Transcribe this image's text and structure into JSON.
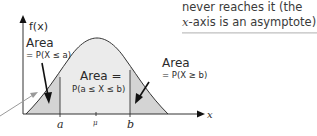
{
  "note": {
    "line1": "never reaches it (the",
    "line2_italic": "x",
    "line2_rest": "-axis is an asymptote)."
  },
  "diagram": {
    "y_axis_label": "f(x)",
    "x_axis_label": "x",
    "left_area": {
      "title": "Area",
      "formula": "= P(X ≤ a)"
    },
    "right_area": {
      "title": "Area",
      "formula": "= P(X ≥ b)"
    },
    "center_area": {
      "title": "Area =",
      "formula": "P(a ≤ X ≤ b)"
    },
    "ticks": {
      "a": "a",
      "mu": "μ",
      "b": "b"
    }
  },
  "colors": {
    "tail_fill": "#d4d4d4",
    "center_fill": "#ebebeb",
    "curve": "#333333",
    "pointer": "#9a9a9a"
  }
}
